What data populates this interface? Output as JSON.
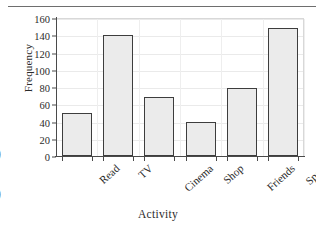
{
  "page": {
    "margin_markers": [
      ")",
      ")"
    ]
  },
  "chart_data": {
    "type": "bar",
    "title": "",
    "xlabel": "Activity",
    "ylabel": "Frequency",
    "categories": [
      "Read",
      "TV",
      "Cinema",
      "Shop",
      "Friends",
      "Sport"
    ],
    "values": [
      50,
      140,
      69,
      39,
      79,
      148
    ],
    "ylim": [
      0,
      160
    ],
    "ytick_labels": [
      "0",
      "20",
      "40",
      "60",
      "80",
      "100",
      "120",
      "140",
      "160"
    ],
    "ytick_values": [
      0,
      20,
      40,
      60,
      80,
      100,
      120,
      140,
      160
    ],
    "grid": true,
    "legend": "none",
    "bar_fill_color": "#ebebeb",
    "bar_edge_color": "#3d3d3d",
    "axis_color": "#4a4a4a",
    "grid_color": "#eaeaea"
  }
}
